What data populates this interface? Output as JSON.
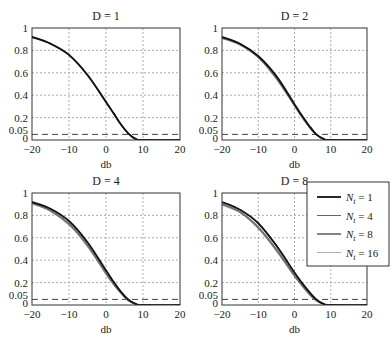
{
  "chart_data": [
    {
      "type": "line",
      "title": "D = 1",
      "xlabel": "db",
      "ylabel": "",
      "xlim": [
        -20,
        20
      ],
      "ylim": [
        0,
        1
      ],
      "xticks": [
        -20,
        -10,
        0,
        10,
        20
      ],
      "yticks": [
        0,
        0.05,
        0.2,
        0.4,
        0.6,
        0.8,
        1
      ],
      "ytick_labels": [
        "0",
        "0.05",
        "0.2",
        "0.4",
        "0.6",
        "0.8",
        "1"
      ],
      "grid": true,
      "reference_line": {
        "y": 0.05,
        "style": "dashed"
      },
      "x": [
        -20,
        -15,
        -10,
        -5,
        0,
        2,
        4,
        6,
        8,
        10
      ],
      "series": [
        {
          "name": "N_t = 1",
          "values": [
            0.92,
            0.86,
            0.76,
            0.58,
            0.34,
            0.24,
            0.14,
            0.06,
            0.01,
            0.0
          ]
        },
        {
          "name": "N_t = 4",
          "values": [
            0.92,
            0.86,
            0.76,
            0.58,
            0.34,
            0.24,
            0.14,
            0.06,
            0.01,
            0.0
          ]
        },
        {
          "name": "N_t = 8",
          "values": [
            0.92,
            0.86,
            0.76,
            0.58,
            0.34,
            0.24,
            0.14,
            0.06,
            0.01,
            0.0
          ]
        },
        {
          "name": "N_t = 16",
          "values": [
            0.92,
            0.86,
            0.76,
            0.58,
            0.34,
            0.24,
            0.14,
            0.06,
            0.01,
            0.0
          ]
        }
      ]
    },
    {
      "type": "line",
      "title": "D = 2",
      "xlabel": "db",
      "ylabel": "",
      "xlim": [
        -20,
        20
      ],
      "ylim": [
        0,
        1
      ],
      "xticks": [
        -20,
        -10,
        0,
        10,
        20
      ],
      "yticks": [
        0,
        0.05,
        0.2,
        0.4,
        0.6,
        0.8,
        1
      ],
      "ytick_labels": [
        "0",
        "0.05",
        "0.2",
        "0.4",
        "0.6",
        "0.8",
        "1"
      ],
      "grid": true,
      "reference_line": {
        "y": 0.05,
        "style": "dashed"
      },
      "x": [
        -20,
        -15,
        -10,
        -5,
        0,
        2,
        4,
        6,
        8,
        10
      ],
      "series": [
        {
          "name": "N_t = 1",
          "values": [
            0.92,
            0.86,
            0.75,
            0.57,
            0.32,
            0.22,
            0.13,
            0.05,
            0.01,
            0.0
          ]
        },
        {
          "name": "N_t = 4",
          "values": [
            0.92,
            0.85,
            0.74,
            0.56,
            0.31,
            0.21,
            0.12,
            0.05,
            0.01,
            0.0
          ]
        },
        {
          "name": "N_t = 8",
          "values": [
            0.91,
            0.85,
            0.74,
            0.55,
            0.31,
            0.21,
            0.12,
            0.05,
            0.01,
            0.0
          ]
        },
        {
          "name": "N_t = 16",
          "values": [
            0.91,
            0.85,
            0.73,
            0.55,
            0.3,
            0.2,
            0.12,
            0.05,
            0.01,
            0.0
          ]
        }
      ]
    },
    {
      "type": "line",
      "title": "D = 4",
      "xlabel": "db",
      "ylabel": "",
      "xlim": [
        -20,
        20
      ],
      "ylim": [
        0,
        1
      ],
      "xticks": [
        -20,
        -10,
        0,
        10,
        20
      ],
      "yticks": [
        0,
        0.05,
        0.2,
        0.4,
        0.6,
        0.8,
        1
      ],
      "ytick_labels": [
        "0",
        "0.05",
        "0.2",
        "0.4",
        "0.6",
        "0.8",
        "1"
      ],
      "grid": true,
      "reference_line": {
        "y": 0.05,
        "style": "dashed"
      },
      "x": [
        -20,
        -15,
        -10,
        -5,
        0,
        2,
        4,
        6,
        8,
        10
      ],
      "series": [
        {
          "name": "N_t = 1",
          "values": [
            0.92,
            0.86,
            0.75,
            0.56,
            0.31,
            0.21,
            0.12,
            0.05,
            0.01,
            0.0
          ]
        },
        {
          "name": "N_t = 4",
          "values": [
            0.91,
            0.85,
            0.73,
            0.54,
            0.29,
            0.19,
            0.11,
            0.04,
            0.01,
            0.0
          ]
        },
        {
          "name": "N_t = 8",
          "values": [
            0.91,
            0.84,
            0.72,
            0.53,
            0.28,
            0.19,
            0.11,
            0.04,
            0.01,
            0.0
          ]
        },
        {
          "name": "N_t = 16",
          "values": [
            0.9,
            0.84,
            0.72,
            0.52,
            0.28,
            0.18,
            0.1,
            0.04,
            0.01,
            0.0
          ]
        }
      ]
    },
    {
      "type": "line",
      "title": "D = 8",
      "xlabel": "db",
      "ylabel": "",
      "xlim": [
        -20,
        20
      ],
      "ylim": [
        0,
        1
      ],
      "xticks": [
        -20,
        -10,
        0,
        10,
        20
      ],
      "yticks": [
        0,
        0.05,
        0.2,
        0.4,
        0.6,
        0.8,
        1
      ],
      "ytick_labels": [
        "0",
        "0.05",
        "0.2",
        "0.4",
        "0.6",
        "0.8",
        "1"
      ],
      "grid": true,
      "reference_line": {
        "y": 0.05,
        "style": "dashed"
      },
      "legend": {
        "position": "upper right",
        "entries": [
          "N_t = 1",
          "N_t = 4",
          "N_t = 8",
          "N_t = 16"
        ]
      },
      "x": [
        -20,
        -15,
        -10,
        -5,
        0,
        2,
        4,
        6,
        8,
        10
      ],
      "series": [
        {
          "name": "N_t = 1",
          "values": [
            0.92,
            0.85,
            0.73,
            0.53,
            0.29,
            0.2,
            0.12,
            0.05,
            0.01,
            0.0
          ]
        },
        {
          "name": "N_t = 4",
          "values": [
            0.9,
            0.83,
            0.7,
            0.5,
            0.27,
            0.18,
            0.1,
            0.04,
            0.01,
            0.0
          ]
        },
        {
          "name": "N_t = 8",
          "values": [
            0.9,
            0.83,
            0.69,
            0.49,
            0.26,
            0.18,
            0.1,
            0.04,
            0.01,
            0.0
          ]
        },
        {
          "name": "N_t = 16",
          "values": [
            0.89,
            0.82,
            0.68,
            0.48,
            0.26,
            0.17,
            0.1,
            0.04,
            0.01,
            0.0
          ]
        }
      ]
    }
  ],
  "legend": {
    "entries": [
      {
        "symbol": "N",
        "subscript": "t",
        "value": "= 1",
        "color": "#111111",
        "width": 1.8
      },
      {
        "symbol": "N",
        "subscript": "t",
        "value": "= 4",
        "color": "#666666",
        "width": 1.0
      },
      {
        "symbol": "N",
        "subscript": "t",
        "value": "= 8",
        "color": "#777777",
        "width": 1.8
      },
      {
        "symbol": "N",
        "subscript": "t",
        "value": "= 16",
        "color": "#999999",
        "width": 0.8
      }
    ]
  },
  "style": {
    "axis_color": "#333333",
    "grid_color": "#8a8a8a",
    "ref_line_color": "#444444"
  }
}
